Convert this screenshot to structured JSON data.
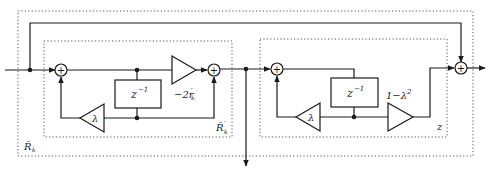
{
  "diagram": {
    "type": "signal-flow block diagram",
    "outer_box": {
      "label": "R̄",
      "label_sub": "k"
    },
    "inner_box_1": {
      "label": "R̄",
      "label_sub": "k",
      "label_sup": "′"
    },
    "inner_box_2": {
      "label": "z"
    },
    "delay_1": {
      "label": "z",
      "label_sup": "−1"
    },
    "delay_2": {
      "label": "z",
      "label_sup": "−1"
    },
    "gain_lambda_1": {
      "label": "λ"
    },
    "gain_lambda_2": {
      "label": "λ"
    },
    "gain_reflection": {
      "label": "−2r",
      "label_sub": "k",
      "label_sup": "′"
    },
    "gain_one_minus": {
      "label": "1−λ",
      "label_sup": "2"
    },
    "summer_symbol": "+",
    "colors": {
      "line": "#1a1a1a",
      "dotted_box": "#555555",
      "background": "#ffffff"
    }
  }
}
